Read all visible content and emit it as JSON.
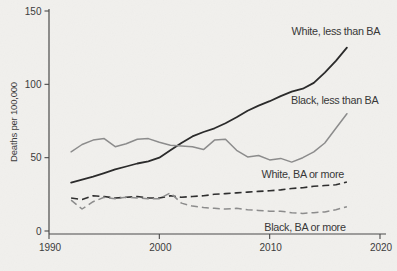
{
  "figure": {
    "background_color": "#f1f0ed",
    "text_color": "#3c3c3c",
    "axis_color": "#4a4a4a"
  },
  "chart_data": {
    "type": "line",
    "title": "",
    "xlabel": "",
    "ylabel": "Deaths per 100,000",
    "xlim": [
      1990,
      2020
    ],
    "ylim": [
      0,
      150
    ],
    "x_ticks": [
      1990,
      2000,
      2010,
      2020
    ],
    "y_ticks": [
      0,
      50,
      100,
      150
    ],
    "grid": "off",
    "legend": "inline-annotations",
    "x": [
      1992,
      1993,
      1994,
      1995,
      1996,
      1997,
      1998,
      1999,
      2000,
      2001,
      2002,
      2003,
      2004,
      2005,
      2006,
      2007,
      2008,
      2009,
      2010,
      2011,
      2012,
      2013,
      2014,
      2015,
      2016,
      2017
    ],
    "series": [
      {
        "name": "white-less-than-ba",
        "label": "White, less than BA",
        "color": "#2b2b2b",
        "style": "solid",
        "stroke_width": 1.8,
        "values": [
          33,
          35,
          37,
          39.5,
          42,
          44,
          46,
          47.5,
          50,
          55,
          60,
          64.5,
          67.5,
          70,
          73.5,
          77.5,
          82,
          85.5,
          88.5,
          92,
          95,
          97,
          101,
          108,
          116,
          125
        ],
        "label_anchor": {
          "year": 2016.0,
          "value": 136
        }
      },
      {
        "name": "black-less-than-ba",
        "label": "Black, less than BA",
        "color": "#8c8c8c",
        "style": "solid",
        "stroke_width": 1.5,
        "values": [
          54,
          59,
          62,
          63,
          57.5,
          59.5,
          62.5,
          63,
          60.5,
          58.5,
          58,
          57.5,
          55.5,
          62,
          62.5,
          55,
          50.5,
          51.5,
          48.5,
          49.5,
          47,
          50,
          54,
          60,
          70,
          80
        ],
        "label_anchor": {
          "year": 2015.9,
          "value": 89
        }
      },
      {
        "name": "white-ba-or-more",
        "label": "White, BA or more",
        "color": "#2f2f2f",
        "style": "dashed",
        "stroke_width": 1.6,
        "values": [
          22.5,
          21.5,
          24,
          23.5,
          22.5,
          23,
          23.5,
          22.5,
          22.5,
          24,
          23,
          23.5,
          24,
          25,
          25.5,
          26,
          26.5,
          27,
          27.5,
          28,
          29,
          29.5,
          30.5,
          31,
          31.5,
          33.5
        ],
        "label_anchor": {
          "year": 2013.0,
          "value": 38.5
        }
      },
      {
        "name": "black-ba-or-more",
        "label": "Black, BA or more",
        "color": "#8c8c8c",
        "style": "dashed",
        "stroke_width": 1.5,
        "values": [
          21,
          15,
          20,
          23,
          22,
          23,
          22.5,
          22,
          22,
          26,
          19,
          17,
          16,
          15.5,
          15,
          15.5,
          14.5,
          14,
          13.5,
          13.5,
          12.5,
          12,
          12.5,
          13,
          14.5,
          16.5
        ],
        "label_anchor": {
          "year": 2013.2,
          "value": 2.5
        }
      }
    ]
  }
}
